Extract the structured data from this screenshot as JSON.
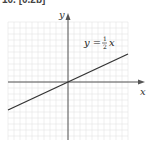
{
  "header": {
    "label": "10. [0.2b]"
  },
  "chart_data": {
    "type": "line",
    "title": "",
    "xlabel": "x",
    "ylabel": "y",
    "grid": true,
    "xlim": [
      -10,
      10
    ],
    "ylim": [
      -9,
      9
    ],
    "series": [
      {
        "name": "y = 1/2 x",
        "x": [
          -10,
          10
        ],
        "y": [
          -5,
          5
        ]
      }
    ],
    "annotations": [
      {
        "text": "y = ½x",
        "position": "upper-right"
      }
    ]
  },
  "labels": {
    "x_axis": "x",
    "y_axis": "y",
    "eq_lhs": "y =",
    "eq_num": "1",
    "eq_den": "2",
    "eq_var": "x"
  },
  "colors": {
    "grid": "#e4e4e4",
    "axis": "#555555",
    "line": "#333333"
  }
}
